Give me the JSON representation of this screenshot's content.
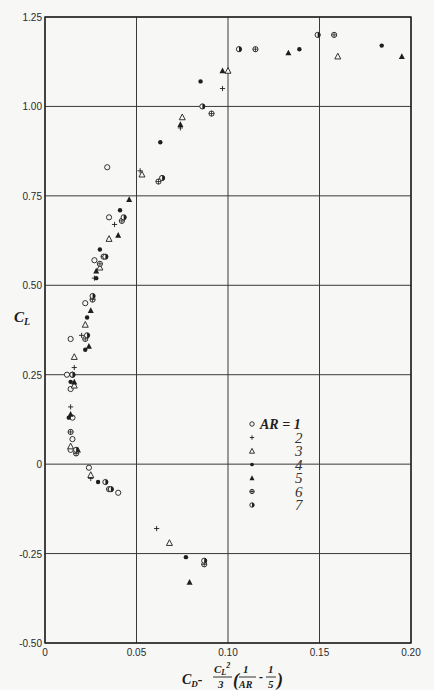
{
  "chart_data": {
    "type": "scatter",
    "title": "",
    "xlabel": "C_D - (C_L^2/3)(1/AR - 1/5)",
    "ylabel": "C_L",
    "xlim": [
      0,
      0.2
    ],
    "ylim": [
      -0.5,
      1.25
    ],
    "x_ticks": [
      "0",
      "0.05",
      "0.10",
      "0.15",
      "0.20"
    ],
    "y_ticks": [
      "1.25",
      "1.00",
      "0.75",
      "0.50",
      "0.25",
      "0",
      "-0.25",
      "-0.50"
    ],
    "grid": true,
    "legend_position": "inside-lower-center",
    "legend_title": "AR =",
    "series": [
      {
        "name": "AR = 1",
        "marker": "open-circle",
        "points": [
          [
            0.034,
            0.83
          ],
          [
            0.035,
            0.69
          ],
          [
            0.027,
            0.57
          ],
          [
            0.022,
            0.45
          ],
          [
            0.014,
            0.35
          ],
          [
            0.012,
            0.25
          ],
          [
            0.014,
            0.21
          ],
          [
            0.015,
            0.13
          ],
          [
            0.015,
            0.07
          ],
          [
            0.014,
            0.04
          ],
          [
            0.024,
            -0.01
          ],
          [
            0.04,
            -0.08
          ]
        ]
      },
      {
        "name": "AR = 2",
        "marker": "plus",
        "points": [
          [
            0.097,
            1.05
          ],
          [
            0.074,
            0.94
          ],
          [
            0.052,
            0.82
          ],
          [
            0.038,
            0.67
          ],
          [
            0.027,
            0.52
          ],
          [
            0.02,
            0.36
          ],
          [
            0.016,
            0.27
          ],
          [
            0.014,
            0.16
          ],
          [
            0.025,
            -0.04
          ],
          [
            0.061,
            -0.18
          ]
        ]
      },
      {
        "name": "AR = 3",
        "marker": "open-triangle",
        "points": [
          [
            0.16,
            1.14
          ],
          [
            0.1,
            1.1
          ],
          [
            0.075,
            0.97
          ],
          [
            0.053,
            0.81
          ],
          [
            0.035,
            0.63
          ],
          [
            0.03,
            0.55
          ],
          [
            0.022,
            0.39
          ],
          [
            0.016,
            0.3
          ],
          [
            0.016,
            0.22
          ],
          [
            0.014,
            0.05
          ],
          [
            0.025,
            -0.03
          ],
          [
            0.068,
            -0.22
          ]
        ]
      },
      {
        "name": "AR = 4",
        "marker": "filled-circle",
        "points": [
          [
            0.184,
            1.17
          ],
          [
            0.139,
            1.16
          ],
          [
            0.085,
            1.07
          ],
          [
            0.063,
            0.9
          ],
          [
            0.041,
            0.71
          ],
          [
            0.03,
            0.6
          ],
          [
            0.028,
            0.52
          ],
          [
            0.023,
            0.41
          ],
          [
            0.022,
            0.32
          ],
          [
            0.014,
            0.23
          ],
          [
            0.013,
            0.13
          ],
          [
            0.014,
            0.09
          ],
          [
            0.029,
            -0.05
          ],
          [
            0.077,
            -0.26
          ]
        ]
      },
      {
        "name": "AR = 5",
        "marker": "filled-triangle",
        "points": [
          [
            0.195,
            1.14
          ],
          [
            0.133,
            1.15
          ],
          [
            0.097,
            1.1
          ],
          [
            0.074,
            0.95
          ],
          [
            0.046,
            0.74
          ],
          [
            0.04,
            0.64
          ],
          [
            0.028,
            0.54
          ],
          [
            0.025,
            0.43
          ],
          [
            0.024,
            0.33
          ],
          [
            0.016,
            0.23
          ],
          [
            0.014,
            0.14
          ],
          [
            0.018,
            0.04
          ],
          [
            0.079,
            -0.33
          ]
        ]
      },
      {
        "name": "AR = 6",
        "marker": "circle-plus",
        "points": [
          [
            0.158,
            1.2
          ],
          [
            0.115,
            1.16
          ],
          [
            0.091,
            0.98
          ],
          [
            0.062,
            0.79
          ],
          [
            0.042,
            0.68
          ],
          [
            0.032,
            0.58
          ],
          [
            0.03,
            0.56
          ],
          [
            0.026,
            0.46
          ],
          [
            0.022,
            0.35
          ],
          [
            0.015,
            0.25
          ],
          [
            0.014,
            0.09
          ],
          [
            0.017,
            0.03
          ],
          [
            0.035,
            -0.07
          ],
          [
            0.087,
            -0.28
          ]
        ]
      },
      {
        "name": "AR = 7",
        "marker": "half-filled-circle",
        "points": [
          [
            0.149,
            1.2
          ],
          [
            0.106,
            1.16
          ],
          [
            0.086,
            1.0
          ],
          [
            0.064,
            0.8
          ],
          [
            0.043,
            0.69
          ],
          [
            0.033,
            0.58
          ],
          [
            0.026,
            0.47
          ],
          [
            0.023,
            0.36
          ],
          [
            0.015,
            0.25
          ],
          [
            0.017,
            0.04
          ],
          [
            0.033,
            -0.05
          ],
          [
            0.036,
            -0.07
          ],
          [
            0.087,
            -0.27
          ]
        ]
      }
    ]
  },
  "legend": {
    "head": "AR = 1",
    "labels": [
      "2",
      "3",
      "4",
      "5",
      "6",
      "7"
    ]
  },
  "axes": {
    "ylabel_text": "C",
    "ylabel_sub": "L",
    "xlabel_main": "C",
    "xlabel_sub": "D"
  }
}
